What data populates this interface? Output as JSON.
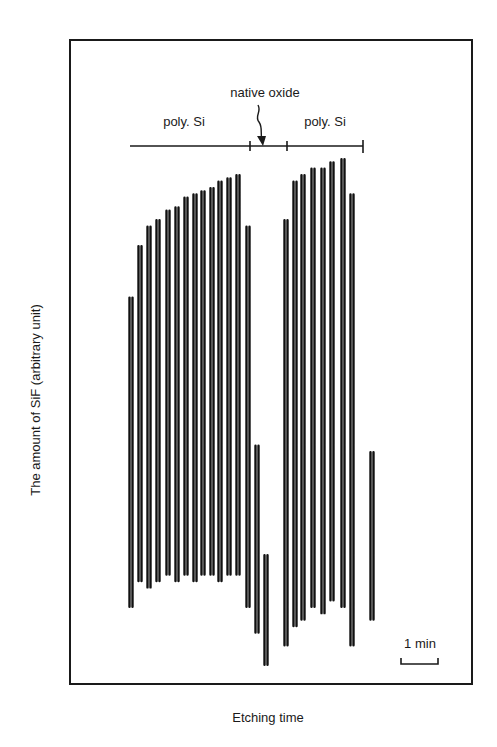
{
  "chart_data": {
    "type": "line",
    "title": "",
    "xlabel": "Etching time",
    "ylabel": "The amount of SiF (arbitrary unit)",
    "grid": false,
    "legend": null,
    "annotations": {
      "regions": [
        {
          "label": "poly. Si",
          "x_start": 130,
          "x_end": 250
        },
        {
          "label": "native oxide",
          "x_start": 250,
          "x_end": 287
        },
        {
          "label": "poly. Si",
          "x_start": 287,
          "x_end": 363
        }
      ],
      "scale_bar": {
        "label": "1 min",
        "width_px": 37
      }
    },
    "series": [
      {
        "name": "SiF signal",
        "description": "oscillating signal; each cycle shown as peak/trough pair in arbitrary units (0 = bottom of frame, 100 = top of frame)",
        "peaks_x_px": [
          131,
          140,
          149,
          158,
          168,
          177,
          186,
          195,
          203,
          212,
          220,
          229,
          238,
          248,
          257,
          266,
          286,
          295,
          303,
          313,
          323,
          332,
          343,
          352,
          372
        ],
        "peak_values": [
          60,
          68,
          71,
          72,
          73.5,
          74,
          75.5,
          76,
          76.5,
          77,
          78,
          78.5,
          79,
          71,
          37,
          20,
          72,
          78,
          79,
          80,
          80,
          81,
          81.5,
          76,
          36
        ],
        "trough_values": [
          12,
          16,
          15,
          16,
          17,
          16,
          17,
          16,
          17,
          17,
          16,
          17,
          17,
          12,
          8,
          3,
          6,
          9,
          10,
          12,
          11,
          13,
          12,
          6,
          10
        ]
      }
    ]
  },
  "labels": {
    "ylabel": "The amount of SiF (arbitrary unit)",
    "xlabel": "Etching time",
    "native_oxide": "native oxide",
    "poly_si_left": "poly. Si",
    "poly_si_right": "poly. Si",
    "scale": "1 min"
  }
}
